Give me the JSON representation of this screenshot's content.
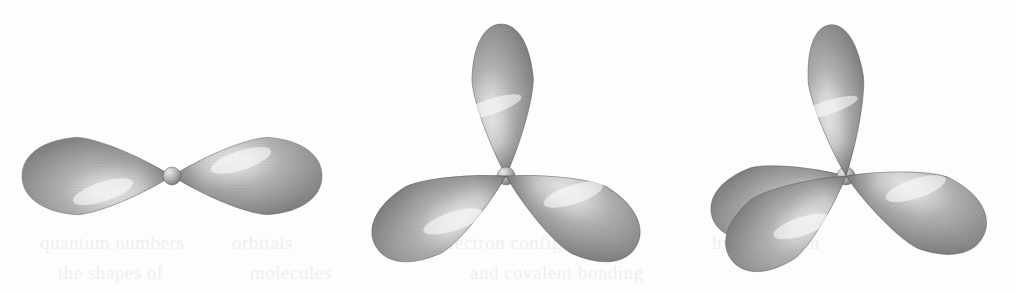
{
  "figure": {
    "background_color": "#fdfdfd",
    "width": 1016,
    "height": 293,
    "render_style": "airbrushed grayscale halftone shading",
    "palette": {
      "lobe_highlight": "#f4f4f4",
      "lobe_midtone": "#b4b4b4",
      "lobe_shadow": "#707070",
      "lobe_edge": "#5e5e5e",
      "nucleus_highlight": "#f0f0f0",
      "nucleus_shadow": "#6e6e6e"
    },
    "bleed_through_text": [
      {
        "text": "quantum numbers",
        "x": 40,
        "y": 232
      },
      {
        "text": "orbitals",
        "x": 232,
        "y": 232
      },
      {
        "text": "electron configuration",
        "x": 440,
        "y": 232
      },
      {
        "text": "hybridization",
        "x": 712,
        "y": 232
      },
      {
        "text": "the shapes of",
        "x": 58,
        "y": 262
      },
      {
        "text": "molecules",
        "x": 250,
        "y": 262
      },
      {
        "text": "and covalent bonding",
        "x": 470,
        "y": 262
      }
    ]
  },
  "orbitals": [
    {
      "name": "sp",
      "label": "sp hybrid orbital set",
      "geometry": "linear",
      "bond_angle": "180°",
      "lobe_count": 2,
      "nucleus": {
        "cx": 172,
        "cy": 176,
        "r": 9
      },
      "lobes": [
        {
          "id": "sp-lobe-left",
          "angle": 180,
          "length": 150,
          "width": 78,
          "z": 1
        },
        {
          "id": "sp-lobe-right",
          "angle": 0,
          "length": 150,
          "width": 78,
          "z": 1
        }
      ]
    },
    {
      "name": "sp2",
      "label": "sp2 hybrid orbital set",
      "geometry": "trigonal planar",
      "bond_angle": "120°",
      "lobe_count": 3,
      "nucleus": {
        "cx": 506,
        "cy": 176,
        "r": 9
      },
      "lobes": [
        {
          "id": "sp2-lobe-up",
          "angle": 92,
          "length": 152,
          "width": 62,
          "z": 1
        },
        {
          "id": "sp2-lobe-lower-left",
          "angle": 208,
          "length": 148,
          "width": 76,
          "z": 2
        },
        {
          "id": "sp2-lobe-lower-right",
          "angle": 332,
          "length": 148,
          "width": 76,
          "z": 2
        }
      ]
    },
    {
      "name": "sp3",
      "label": "sp3 hybrid orbital set",
      "geometry": "tetrahedral",
      "bond_angle": "109.5°",
      "lobe_count": 4,
      "nucleus": {
        "cx": 846,
        "cy": 176,
        "r": 9
      },
      "lobes": [
        {
          "id": "sp3-lobe-up",
          "angle": 96,
          "length": 152,
          "width": 56,
          "z": 3
        },
        {
          "id": "sp3-lobe-back-left",
          "angle": 197,
          "length": 140,
          "width": 72,
          "z": 1
        },
        {
          "id": "sp3-lobe-front-left",
          "angle": 216,
          "length": 142,
          "width": 74,
          "z": 2
        },
        {
          "id": "sp3-lobe-right",
          "angle": 337,
          "length": 150,
          "width": 78,
          "z": 2
        }
      ]
    }
  ]
}
